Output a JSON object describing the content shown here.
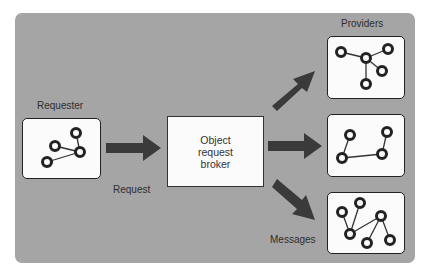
{
  "diagram": {
    "title": "",
    "labels": {
      "requester": "Requester",
      "providers": "Providers",
      "request": "Request",
      "messages": "Messages"
    },
    "broker": {
      "lines": [
        "Object",
        "request",
        "broker"
      ]
    },
    "nodes": [
      {
        "id": "requester",
        "label": "Requester",
        "type": "network-box"
      },
      {
        "id": "broker",
        "label": "Object request broker",
        "type": "box"
      },
      {
        "id": "provider-1",
        "label": "Provider (star network)",
        "type": "network-box"
      },
      {
        "id": "provider-2",
        "label": "Provider (chain network)",
        "type": "network-box"
      },
      {
        "id": "provider-3",
        "label": "Provider (tree network)",
        "type": "network-box"
      }
    ],
    "edges": [
      {
        "from": "requester",
        "to": "broker",
        "label": "Request"
      },
      {
        "from": "broker",
        "to": "provider-1",
        "label": ""
      },
      {
        "from": "broker",
        "to": "provider-2",
        "label": ""
      },
      {
        "from": "broker",
        "to": "provider-3",
        "label": "Messages"
      }
    ],
    "colors": {
      "panel": "#a5a5a5",
      "box": "#fbfbfb",
      "arrow": "#3a3a3a",
      "text": "#2e2e2e"
    }
  }
}
